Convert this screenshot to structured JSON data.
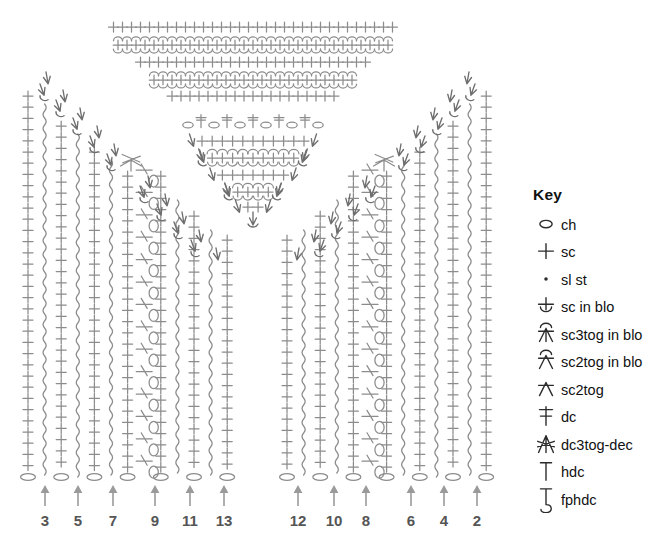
{
  "diagram": {
    "type": "crochet-pattern-schematic"
  },
  "key": {
    "title": "Key",
    "items": [
      {
        "symbol": "ch-icon",
        "label": "ch"
      },
      {
        "symbol": "sc-icon",
        "label": "sc"
      },
      {
        "symbol": "sl-st-icon",
        "label": "sl st"
      },
      {
        "symbol": "sc-in-blo-icon",
        "label": "sc in blo"
      },
      {
        "symbol": "sc3tog-in-blo-icon",
        "label": "sc3tog in blo"
      },
      {
        "symbol": "sc2tog-in-blo-icon",
        "label": "sc2tog in blo"
      },
      {
        "symbol": "sc2tog-icon",
        "label": "sc2tog"
      },
      {
        "symbol": "dc-icon",
        "label": "dc"
      },
      {
        "symbol": "dc3tog-dec-icon",
        "label": "dc3tog-dec"
      },
      {
        "symbol": "hdc-icon",
        "label": "hdc"
      },
      {
        "symbol": "fphdc-icon",
        "label": "fphdc"
      }
    ]
  },
  "row_markers": {
    "left": [
      {
        "label": "3",
        "x": 45
      },
      {
        "label": "5",
        "x": 78
      },
      {
        "label": "7",
        "x": 113
      },
      {
        "label": "9",
        "x": 155
      },
      {
        "label": "11",
        "x": 190
      },
      {
        "label": "13",
        "x": 224
      }
    ],
    "right": [
      {
        "label": "12",
        "x": 298
      },
      {
        "label": "10",
        "x": 334
      },
      {
        "label": "8",
        "x": 366
      },
      {
        "label": "6",
        "x": 411
      },
      {
        "label": "4",
        "x": 444
      },
      {
        "label": "2",
        "x": 477
      }
    ]
  },
  "colors": {
    "symbol_gray": "#8c8c8c",
    "symbol_dark_gray": "#6e6e6e",
    "arrow_gray": "#9a9a9a",
    "row_number": "#555555",
    "key_text": "#111111",
    "background": "#ffffff"
  },
  "chart_data": {
    "type": "diagram",
    "sections": [
      {
        "name": "top-yoke",
        "rows": [
          {
            "stitch": "sc",
            "count": 32
          },
          {
            "stitch": "sc in blo",
            "count": 31
          },
          {
            "stitch": "sc",
            "count": 26
          },
          {
            "stitch": "sc in blo",
            "count": 23
          },
          {
            "stitch": "sc",
            "count": 19
          }
        ]
      },
      {
        "name": "center-v-neck",
        "rows": [
          {
            "stitch": "dc with ch between",
            "count": 5
          },
          {
            "stitch": "sc",
            "count": 11
          },
          {
            "stitch": "sc in blo",
            "count": 9
          },
          {
            "stitch": "sc",
            "count": 7
          },
          {
            "stitch": "sc in blo",
            "count": 4
          },
          {
            "stitch": "sc",
            "count": 2
          },
          {
            "stitch": "sc2tog",
            "count": 1
          }
        ]
      },
      {
        "name": "left-panel",
        "columns": [
          "sc",
          "fphdc",
          "sc",
          "fphdc",
          "sc",
          "dc/ch",
          "sc",
          "fphdc",
          "sc",
          "fphdc",
          "sc",
          "fphdc"
        ],
        "base_row": "ch",
        "row_numbers": [
          "3",
          "5",
          "7",
          "9",
          "11",
          "13"
        ]
      },
      {
        "name": "right-panel",
        "columns": [
          "fphdc",
          "sc",
          "fphdc",
          "sc",
          "fphdc",
          "sc",
          "dc/ch",
          "sc",
          "fphdc",
          "sc",
          "fphdc",
          "sc"
        ],
        "base_row": "ch",
        "row_numbers": [
          "12",
          "10",
          "8",
          "6",
          "4",
          "2"
        ]
      }
    ],
    "legend": [
      "ch",
      "sc",
      "sl st",
      "sc in blo",
      "sc3tog in blo",
      "sc2tog in blo",
      "sc2tog",
      "dc",
      "dc3tog-dec",
      "hdc",
      "fphdc"
    ]
  }
}
